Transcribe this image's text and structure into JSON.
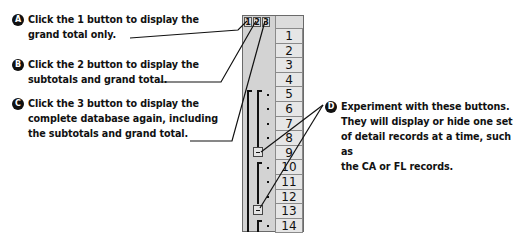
{
  "callouts": [
    {
      "badge": "A",
      "lines": [
        "Click the 1 button to display the",
        "grand total only."
      ]
    },
    {
      "badge": "B",
      "lines": [
        "Click the 2 button to display the",
        "subtotals and grand total."
      ]
    },
    {
      "badge": "C",
      "lines": [
        "Click the 3 button to display the",
        "complete database again, including",
        "the subtotals and grand total."
      ]
    },
    {
      "badge": "D",
      "lines": [
        "Experiment with these buttons.",
        "They will display or hide one set",
        "of detail records at a time, such as",
        "the CA or FL records."
      ]
    }
  ],
  "outline_panel": {
    "level_buttons": [
      "1",
      "2",
      "3"
    ],
    "row_headers": [
      "1",
      "2",
      "3",
      "4",
      "5",
      "6",
      "7",
      "8",
      "9",
      "10",
      "11",
      "12",
      "13",
      "14"
    ],
    "collapse_buttons": [
      {
        "row": "9",
        "symbol": "minus"
      },
      {
        "row": "13",
        "symbol": "minus"
      }
    ]
  }
}
